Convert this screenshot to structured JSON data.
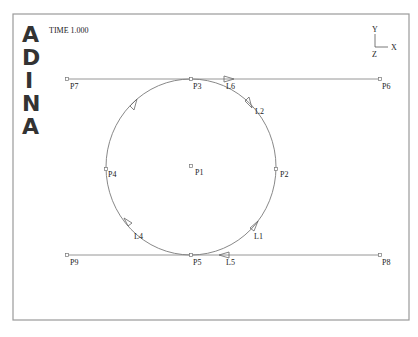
{
  "header": {
    "logo_letters": [
      "A",
      "D",
      "I",
      "N",
      "A"
    ],
    "time_label": "TIME 1.000"
  },
  "triad": {
    "y_label": "Y",
    "x_label": "X",
    "z_label": "Z"
  },
  "colors": {
    "frame": "#9a9a9a",
    "geometry": "#8a8a8a",
    "text": "#222222",
    "logo": "#333333"
  },
  "points": [
    {
      "id": "P1",
      "label": "P1",
      "x": 191,
      "y": 166
    },
    {
      "id": "P2",
      "label": "P2",
      "x": 276,
      "y": 169
    },
    {
      "id": "P3",
      "label": "P3",
      "x": 191,
      "y": 79
    },
    {
      "id": "P4",
      "label": "P4",
      "x": 106,
      "y": 169
    },
    {
      "id": "P5",
      "label": "P5",
      "x": 191,
      "y": 255
    },
    {
      "id": "P6",
      "label": "P6",
      "x": 380,
      "y": 79
    },
    {
      "id": "P7",
      "label": "P7",
      "x": 67,
      "y": 79
    },
    {
      "id": "P8",
      "label": "P8",
      "x": 380,
      "y": 255
    },
    {
      "id": "P9",
      "label": "P9",
      "x": 67,
      "y": 255
    }
  ],
  "lines": [
    {
      "id": "L1",
      "label": "L1"
    },
    {
      "id": "L2",
      "label": "L2"
    },
    {
      "id": "L3",
      "label": "L3"
    },
    {
      "id": "L4",
      "label": "L4"
    },
    {
      "id": "L5",
      "label": "L5"
    },
    {
      "id": "L6",
      "label": "L6"
    }
  ]
}
